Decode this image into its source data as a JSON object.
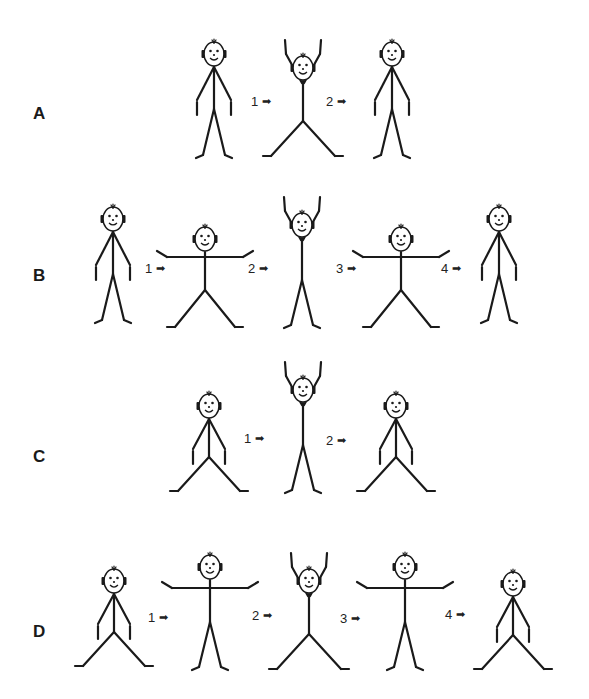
{
  "arrow_glyph": "➡",
  "rows": [
    {
      "label": "A",
      "label_pos": [
        33,
        112
      ],
      "figures": [
        {
          "pose": "stand",
          "x": 214,
          "y": 40
        },
        {
          "pose": "hands_up_legs_wide",
          "x": 303,
          "y": 40
        },
        {
          "pose": "stand",
          "x": 392,
          "y": 40
        }
      ],
      "steps": [
        {
          "num": "1",
          "x": 251,
          "y": 94
        },
        {
          "num": "2",
          "x": 326,
          "y": 94
        }
      ]
    },
    {
      "label": "B",
      "label_pos": [
        33,
        274
      ],
      "figures": [
        {
          "pose": "stand",
          "x": 113,
          "y": 205
        },
        {
          "pose": "arms_out_legs_wide",
          "x": 205,
          "y": 225
        },
        {
          "pose": "hands_up_legs_closed",
          "x": 302,
          "y": 197
        },
        {
          "pose": "arms_out_legs_wide",
          "x": 401,
          "y": 225
        },
        {
          "pose": "stand",
          "x": 499,
          "y": 205
        }
      ],
      "steps": [
        {
          "num": "1",
          "x": 145,
          "y": 261
        },
        {
          "num": "2",
          "x": 248,
          "y": 261
        },
        {
          "num": "3",
          "x": 336,
          "y": 261
        },
        {
          "num": "4",
          "x": 441,
          "y": 261
        }
      ]
    },
    {
      "label": "C",
      "label_pos": [
        33,
        455
      ],
      "figures": [
        {
          "pose": "arms_down_legs_wide",
          "x": 209,
          "y": 392
        },
        {
          "pose": "hands_up_legs_closed",
          "x": 303,
          "y": 362
        },
        {
          "pose": "arms_down_legs_wide",
          "x": 396,
          "y": 392
        }
      ],
      "steps": [
        {
          "num": "1",
          "x": 244,
          "y": 431
        },
        {
          "num": "2",
          "x": 326,
          "y": 433
        }
      ]
    },
    {
      "label": "D",
      "label_pos": [
        33,
        630
      ],
      "figures": [
        {
          "pose": "arms_down_legs_wide",
          "x": 114,
          "y": 567
        },
        {
          "pose": "arms_out_legs_closed",
          "x": 210,
          "y": 553
        },
        {
          "pose": "hands_up_legs_wide",
          "x": 309,
          "y": 553
        },
        {
          "pose": "arms_out_legs_closed",
          "x": 405,
          "y": 553
        },
        {
          "pose": "arms_down_legs_wide",
          "x": 513,
          "y": 570
        }
      ],
      "steps": [
        {
          "num": "1",
          "x": 148,
          "y": 610
        },
        {
          "num": "2",
          "x": 252,
          "y": 608
        },
        {
          "num": "3",
          "x": 340,
          "y": 611
        },
        {
          "num": "4",
          "x": 445,
          "y": 607
        }
      ]
    }
  ],
  "colors": {
    "ink": "#1a1a1a",
    "background": "#ffffff"
  }
}
